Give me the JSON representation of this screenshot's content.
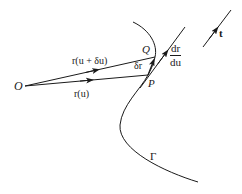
{
  "diagram": {
    "type": "vector-calculus-tangent",
    "labels": {
      "origin": "O",
      "point_p": "P",
      "point_q": "Q",
      "r_u": "r(u)",
      "r_u_du": "r(u + δu)",
      "delta_r": "δr",
      "dr_du_num": "dr",
      "dr_du_den": "du",
      "tangent_unit": "t",
      "curve": "Γ"
    },
    "colors": {
      "ink": "#1a1a1a",
      "background": "#ffffff"
    }
  }
}
